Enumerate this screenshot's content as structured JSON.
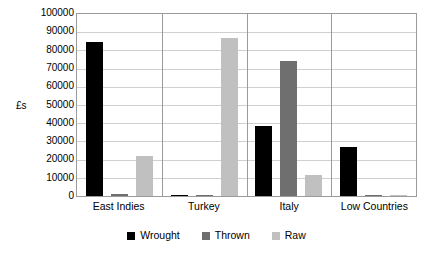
{
  "chart_data": {
    "type": "bar",
    "title": "",
    "subtitle": "",
    "xlabel": "",
    "ylabel": "£s",
    "ylim": [
      0,
      100000
    ],
    "ytick_step": 10000,
    "yticks": [
      "100000",
      "90000",
      "80000",
      "70000",
      "60000",
      "50000",
      "40000",
      "30000",
      "20000",
      "10000",
      "0"
    ],
    "grid": true,
    "legend_position": "bottom-center",
    "categories": [
      "East Indies",
      "Turkey",
      "Italy",
      "Low Countries"
    ],
    "series": [
      {
        "name": "Wrought",
        "color": "#000000",
        "values": [
          84500,
          500,
          38500,
          27000
        ]
      },
      {
        "name": "Thrown",
        "color": "#6f6f6f",
        "values": [
          1000,
          0,
          74000,
          400
        ]
      },
      {
        "name": "Raw",
        "color": "#c0c0c0",
        "values": [
          22000,
          87000,
          11500,
          800
        ]
      }
    ]
  },
  "colors": {
    "plot_border": "#9b9b9b",
    "gridline": "#cfcfcf",
    "background": "#ffffff",
    "text": "#000000"
  }
}
